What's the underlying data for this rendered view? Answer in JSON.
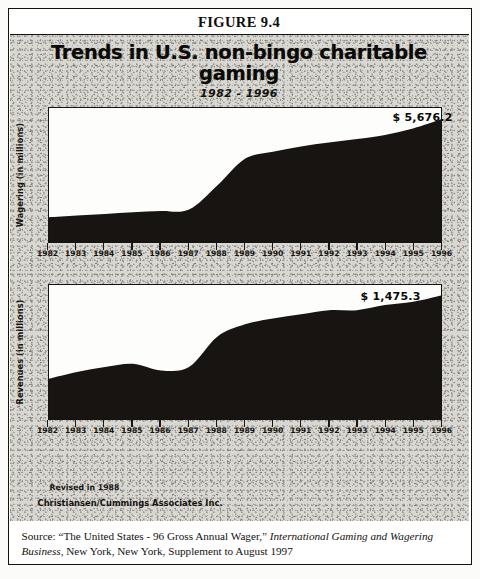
{
  "figure": {
    "label": "FIGURE 9.4",
    "title": "Trends in U.S. non-bingo charitable gaming",
    "subtitle": "1982 - 1996"
  },
  "notes": {
    "revised": "Revised in 1988",
    "credit": "Christiansen/Cummings Associates Inc."
  },
  "source": {
    "prefix": "Source: “The United States - 96 Gross Annual Wager,” ",
    "italic1": "International Gaming and Wagering Business",
    "suffix": ", New York, New York, Supplement to August 1997"
  },
  "colors": {
    "ink": "#15120f",
    "area_fill": "#171412",
    "panel_bg": "#d9d7d2",
    "plot_bg": "#fdfdfc"
  },
  "chart_data": [
    {
      "type": "area",
      "title": "Trends in U.S. non-bingo charitable gaming",
      "subtitle": "1982 - 1996",
      "xlabel": "",
      "ylabel": "Wagering (in millions)",
      "grid": false,
      "legend": false,
      "end_value_label": "$ 5,676.2",
      "xlim": [
        1982,
        1996
      ],
      "ylim": [
        0,
        6200
      ],
      "x": [
        1982,
        1983,
        1984,
        1985,
        1986,
        1987,
        1988,
        1989,
        1990,
        1991,
        1992,
        1993,
        1994,
        1995,
        1996
      ],
      "categories": [
        "1982",
        "1983",
        "1984",
        "1985",
        "1986",
        "1987",
        "1988",
        "1989",
        "1990",
        "1991",
        "1992",
        "1993",
        "1994",
        "1995",
        "1996"
      ],
      "values": [
        1150,
        1230,
        1300,
        1380,
        1430,
        1500,
        2600,
        3850,
        4180,
        4420,
        4600,
        4760,
        4950,
        5250,
        5676.2
      ]
    },
    {
      "type": "area",
      "title": "Trends in U.S. non-bingo charitable gaming",
      "subtitle": "1982 - 1996",
      "xlabel": "",
      "ylabel": "Revenues (in millions)",
      "grid": false,
      "legend": false,
      "end_value_label": "$ 1,475.3",
      "xlim": [
        1982,
        1996
      ],
      "ylim": [
        0,
        1600
      ],
      "x": [
        1982,
        1983,
        1984,
        1985,
        1986,
        1987,
        1988,
        1989,
        1990,
        1991,
        1992,
        1993,
        1994,
        1995,
        1996
      ],
      "categories": [
        "1982",
        "1983",
        "1984",
        "1985",
        "1986",
        "1987",
        "1988",
        "1989",
        "1990",
        "1991",
        "1992",
        "1993",
        "1994",
        "1995",
        "1996"
      ],
      "values": [
        480,
        560,
        620,
        660,
        580,
        620,
        980,
        1130,
        1200,
        1250,
        1300,
        1300,
        1360,
        1400,
        1475.3
      ]
    }
  ]
}
